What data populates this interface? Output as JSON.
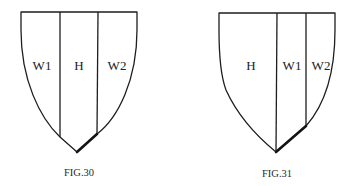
{
  "figures": [
    {
      "caption": "FIG.30",
      "stripes": [
        {
          "label": "W1"
        },
        {
          "label": "H"
        },
        {
          "label": "W2"
        }
      ]
    },
    {
      "caption": "FIG.31",
      "stripes": [
        {
          "label": "H"
        },
        {
          "label": "W1"
        },
        {
          "label": "W2"
        }
      ]
    }
  ],
  "colors": {
    "line": "#1e1e1e",
    "text": "#222222",
    "background": "#ffffff"
  }
}
